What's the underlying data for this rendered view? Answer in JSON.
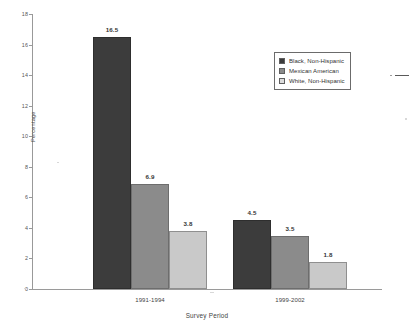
{
  "chart_data": {
    "type": "bar",
    "title": "",
    "xlabel": "Survey Period",
    "ylabel": "Percentage",
    "categories": [
      "1991-1994",
      "1999-2002"
    ],
    "series": [
      {
        "name": "Black, Non-Hispanic",
        "color": "#3c3c3c",
        "values": [
          16.5,
          4.5
        ]
      },
      {
        "name": "Mexican American",
        "color": "#8b8b8b",
        "values": [
          6.9,
          3.5
        ]
      },
      {
        "name": "White, Non-Hispanic",
        "color": "#c9c9c9",
        "values": [
          3.8,
          1.8
        ]
      }
    ],
    "ylim": [
      0,
      18
    ],
    "yticks": [
      0,
      2,
      4,
      6,
      8,
      10,
      12,
      14,
      16,
      18
    ],
    "ytick_labels": [
      "0",
      "2",
      "4",
      "6",
      "8",
      "10",
      "12",
      "14",
      "16",
      "18"
    ],
    "grid": false,
    "legend_position": "upper right",
    "data_labels": [
      "16.5",
      "6.9",
      "3.8",
      "4.5",
      "3.5",
      "1.8"
    ]
  },
  "legend": {
    "items": [
      {
        "label": "Black, Non-Hispanic"
      },
      {
        "label": "Mexican American"
      },
      {
        "label": "White, Non-Hispanic"
      }
    ]
  }
}
